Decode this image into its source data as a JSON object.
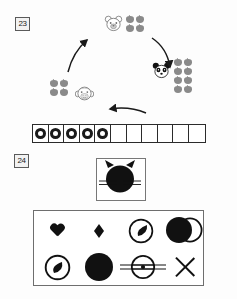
{
  "page": {
    "type": "math-worksheet-scan",
    "width": 237,
    "height": 299,
    "background_color": "#fdfdfd"
  },
  "problems": [
    {
      "number": "23",
      "kind": "apple-sharing-cycle",
      "groups": [
        {
          "id": "top",
          "animal": "bear-face",
          "animal_side": "left",
          "apple_count": 4,
          "apple_rows": 2,
          "apple_cols": 2,
          "apple_color": "#8a8a8a"
        },
        {
          "id": "right",
          "animal": "panda-face",
          "animal_side": "left",
          "apple_count": 8,
          "apple_rows": 4,
          "apple_cols": 2,
          "apple_color": "#8a8a8a"
        },
        {
          "id": "left",
          "animal": "monkey-face",
          "animal_side": "right",
          "apple_count": 4,
          "apple_rows": 2,
          "apple_cols": 2,
          "apple_color": "#8a8a8a"
        }
      ],
      "arrows": [
        {
          "id": "top-to-right",
          "direction": "down-right",
          "curved": true
        },
        {
          "id": "right-to-left",
          "direction": "left",
          "curved": true
        },
        {
          "id": "left-to-top",
          "direction": "up-right",
          "curved": true
        }
      ],
      "counting_strip": {
        "total_cells": 11,
        "filled_cells": 5,
        "mark": "circle-outline",
        "mark_color": "#1a1a1a",
        "border_color": "#2b2b2b"
      }
    },
    {
      "number": "24",
      "kind": "shape-identification",
      "reference_box": {
        "figure": "cat-silhouette-with-whiskers",
        "fill_color": "#111111",
        "border_color": "#777777"
      },
      "shape_panel": {
        "border_color": "#6e6e6e",
        "rows": 2,
        "cols": 4,
        "shapes": [
          {
            "slot": 1,
            "name": "heart",
            "fill": "solid-black"
          },
          {
            "slot": 2,
            "name": "diamond",
            "fill": "solid-black"
          },
          {
            "slot": 3,
            "name": "circle-with-leaf-inside",
            "fill": "outline-plus-solid"
          },
          {
            "slot": 4,
            "name": "overlapping-circle-and-ring",
            "fill": "solid-and-outline"
          },
          {
            "slot": 5,
            "name": "ring-with-teardrop-inside",
            "fill": "outline-plus-solid"
          },
          {
            "slot": 6,
            "name": "solid-circle",
            "fill": "solid-black"
          },
          {
            "slot": 7,
            "name": "circle-with-horizontal-lines-and-dot",
            "fill": "outline"
          },
          {
            "slot": 8,
            "name": "x-cross",
            "fill": "outline"
          }
        ]
      }
    }
  ]
}
